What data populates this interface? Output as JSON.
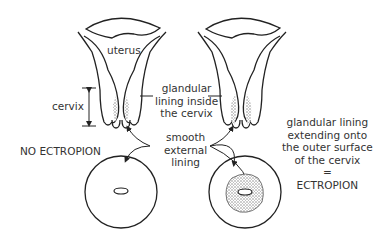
{
  "labels": {
    "uterus": "uterus",
    "cervix": "cervix",
    "glandular_inside": [
      "glandular",
      "lining inside",
      "the cervix"
    ],
    "smooth_external": [
      "smooth",
      "external",
      "lining"
    ],
    "no_ectropion": "NO ECTROPION",
    "glandular_extending": [
      "glandular lining",
      "extending onto",
      "the outer surface",
      "of the cervix",
      "=",
      "ECTROPION"
    ]
  },
  "colors": {
    "line": "#222222",
    "text": "#333333",
    "stipple": "#999999"
  }
}
